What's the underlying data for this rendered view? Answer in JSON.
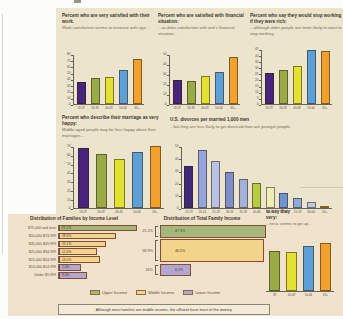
{
  "figure": {
    "caption": "Although most families are middle income, the affluent have most of the money.",
    "legend": {
      "items": [
        {
          "label": "Upper Income",
          "color": "#a2b97a"
        },
        {
          "label": "Middle Income",
          "color": "#f2d48a"
        },
        {
          "label": "Lower Income",
          "color": "#b2a7cf"
        }
      ]
    }
  },
  "colors": {
    "panel_top": "#ece4cd",
    "panel_bottom": "#f0e2cb",
    "axis": "#6b6257",
    "title_text": "#40362c",
    "subtitle_text": "#776a59",
    "bar_outline": "#8a4a36"
  },
  "chart_data": [
    {
      "id": "work-satisfaction",
      "type": "bar",
      "title": "Percent who are very satisfied with their work.",
      "subtitle": "Work satisfaction seems to increase with age...",
      "categories": [
        "18-29",
        "30-39",
        "40-49",
        "50-64",
        "65+"
      ],
      "values": [
        36,
        42,
        44,
        55,
        72
      ],
      "ylim": [
        0,
        80
      ],
      "ytick": 10,
      "bar_colors": [
        "#46257b",
        "#9aab45",
        "#e3e233",
        "#5e9fd6",
        "#f2a12f"
      ]
    },
    {
      "id": "financial-satisfaction",
      "type": "bar",
      "title": "Percent who are satisfied with financial situation:",
      "subtitle": "...as does satisfaction with one's financial situation...",
      "categories": [
        "18-29",
        "30-39",
        "40-49",
        "50-64",
        "65+"
      ],
      "values": [
        24,
        23,
        28,
        32,
        47
      ],
      "ylim": [
        0,
        50
      ],
      "ytick": 10,
      "bar_colors": [
        "#46257b",
        "#9aab45",
        "#e3e233",
        "#5e9fd6",
        "#f2a12f"
      ]
    },
    {
      "id": "stop-working-if-rich",
      "type": "bar",
      "title": "Percent who say they would stop working if they were rich:",
      "subtitle": "...although older people are more likely to want to stop working.",
      "categories": [
        "18-29",
        "30-39",
        "40-49",
        "50-64",
        "65+"
      ],
      "values": [
        25,
        28,
        31,
        44,
        43
      ],
      "ylim": [
        0,
        45
      ],
      "ytick": 5,
      "bar_colors": [
        "#46257b",
        "#9aab45",
        "#e3e233",
        "#5e9fd6",
        "#f2a12f"
      ]
    },
    {
      "id": "marriage-very-happy",
      "type": "bar",
      "title": "Percent who describe their marriage as very happy:",
      "subtitle": "Middle-aged people may be less happy about their marriages...",
      "categories": [
        "18-29",
        "30-39",
        "40-49",
        "50-64",
        "65+"
      ],
      "values": [
        68,
        61,
        55,
        63,
        70
      ],
      "ylim": [
        0,
        70
      ],
      "ytick": 10,
      "bar_colors": [
        "#46257b",
        "#9aab45",
        "#e3e233",
        "#5e9fd6",
        "#f2a12f"
      ]
    },
    {
      "id": "us-divorces",
      "type": "bar",
      "title": "U.S. divorces per married 1,000 men",
      "subtitle": "...but they are less likely to get divorced than are younger people.",
      "categories": [
        "15-19",
        "20-24",
        "25-29",
        "30-34",
        "35-39",
        "40-44",
        "45-49",
        "50-54",
        "55-59",
        "60-64",
        "65+"
      ],
      "values": [
        34,
        47,
        38,
        29,
        23,
        20,
        17,
        12,
        8,
        5,
        1
      ],
      "ylim": [
        0,
        50
      ],
      "ytick": 10,
      "bar_colors": [
        "#3f2878",
        "#93a5da",
        "#b9c1e4",
        "#7e90c6",
        "#a4b2da",
        "#b8cc44",
        "#efedb4",
        "#6e93d0",
        "#8fa9da",
        "#bccbe6",
        "#eda42f"
      ]
    },
    {
      "id": "families-by-income-level",
      "type": "hbar",
      "title": "Distribution of Families by Income Level",
      "categories": [
        "$75,000 and over",
        "$50,000-$74,999",
        "$35,000-$49,999",
        "$25,000-$34,999",
        "$15,000-$24,999",
        "$10,000-$14,999",
        "Under $9,999"
      ],
      "values": [
        25.1,
        18.3,
        15.1,
        12.3,
        13.2,
        7.0,
        9.0
      ],
      "value_labels": [
        "25.1%",
        "18.3%",
        "15.1%",
        "12.3%",
        "13.2%",
        "7.0%",
        "9.0%"
      ],
      "bar_colors": [
        "#a2b97a",
        "#f2d48a",
        "#f2d48a",
        "#f2d48a",
        "#f2d48a",
        "#b2a7cf",
        "#b2a7cf"
      ]
    },
    {
      "id": "total-family-income",
      "type": "stacked",
      "title": "Distribution of Total Family Income",
      "rows": [
        {
          "group": "Upper income",
          "family_share_label": "25.1%",
          "income_share_label": "47.3%",
          "income_share": 47.3,
          "color": "#a2b97a"
        },
        {
          "group": "Middle income",
          "family_share_label": "58.9%",
          "income_share_label": "46.5%",
          "income_share": 46.5,
          "color": "#f2d48a"
        },
        {
          "group": "Lower income",
          "family_share_label": "16%",
          "income_share_label": "6.2%",
          "income_share": 6.2,
          "color": "#b2a7cf"
        }
      ]
    },
    {
      "id": "very-happy-cropped",
      "type": "bar",
      "title_line1": "to say they",
      "title_line2": "very:",
      "subtitle": "...ness seems to go up...",
      "categories": [
        "39",
        "40-49",
        "50-64",
        "65+"
      ],
      "values": [
        48,
        47,
        54,
        58
      ],
      "ylim": [
        0,
        60
      ],
      "ytick": 10,
      "hide_axis": true,
      "bar_colors": [
        "#9aab45",
        "#e3e233",
        "#5e9fd6",
        "#f2a12f"
      ]
    }
  ]
}
